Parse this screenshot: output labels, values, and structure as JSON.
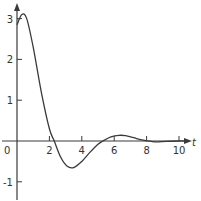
{
  "chart_data": {
    "type": "line",
    "title": "",
    "xlabel": "t",
    "ylabel": "",
    "xlim": [
      -1,
      10.5
    ],
    "ylim": [
      -1.3,
      3.3
    ],
    "grid": false,
    "legend": null,
    "x_ticks": [
      0,
      2,
      4,
      6,
      8,
      10
    ],
    "x_tick_labels": [
      "0",
      "2",
      "4",
      "6",
      "8",
      "10"
    ],
    "y_ticks": [
      -1,
      1,
      2,
      3
    ],
    "y_tick_labels": [
      "-1",
      "1",
      "2",
      "3"
    ],
    "series": [
      {
        "name": "f(t)",
        "x": [
          0,
          0.3,
          0.6,
          1.0,
          1.5,
          2.0,
          2.3,
          2.7,
          3.1,
          3.5,
          4.0,
          4.5,
          5.0,
          5.3,
          5.8,
          6.3,
          6.7,
          7.2,
          7.8,
          8.5,
          9.2,
          10.0,
          10.3
        ],
        "values": [
          2.85,
          3.1,
          3.0,
          2.3,
          1.2,
          0.3,
          0.0,
          -0.4,
          -0.62,
          -0.65,
          -0.5,
          -0.28,
          -0.08,
          0.0,
          0.1,
          0.14,
          0.13,
          0.08,
          0.02,
          -0.02,
          -0.01,
          0.0,
          0.0
        ]
      }
    ]
  },
  "labels": {
    "x_axis_var": "t",
    "origin": "0"
  }
}
